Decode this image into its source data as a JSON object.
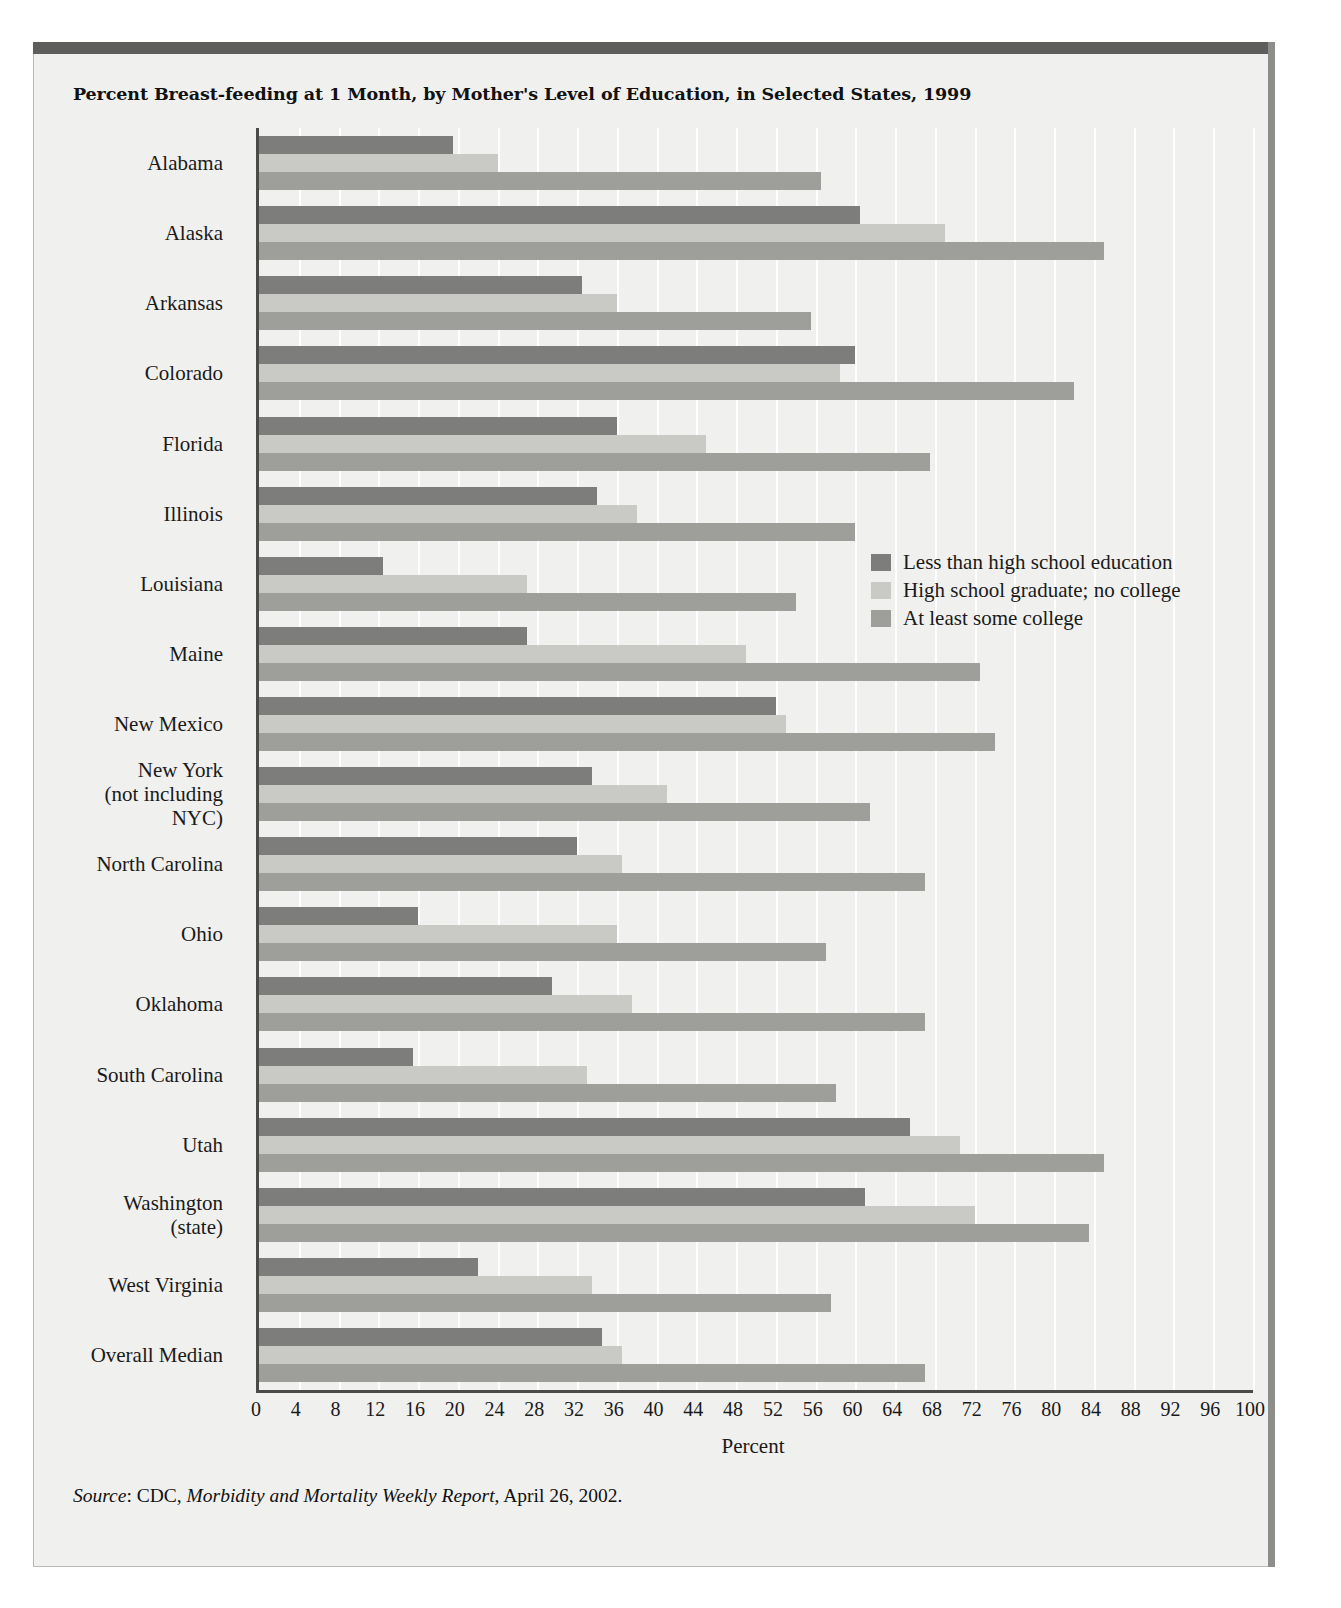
{
  "title": "Percent Breast-feeding at 1 Month, by Mother's Level of Education, in Selected States, 1999",
  "source": {
    "label": "Source",
    "agency": "CDC",
    "publication": "Morbidity and Mortality Weekly Report",
    "date": "April 26, 2002."
  },
  "legend": [
    {
      "label": "Less than high school education",
      "color": "#7d7d7b"
    },
    {
      "label": "High school graduate; no college",
      "color": "#c9c9c6"
    },
    {
      "label": "At least some college",
      "color": "#9e9e9b"
    }
  ],
  "chart_data": {
    "type": "bar",
    "orientation": "horizontal",
    "title": "Percent Breast-feeding at 1 Month, by Mother's Level of Education, in Selected States, 1999",
    "xlabel": "Percent",
    "ylabel": "",
    "xlim": [
      0,
      100
    ],
    "xticks": [
      0,
      4,
      8,
      12,
      16,
      20,
      24,
      28,
      32,
      36,
      40,
      44,
      48,
      52,
      56,
      60,
      64,
      68,
      72,
      76,
      80,
      84,
      88,
      92,
      96,
      100
    ],
    "grid": true,
    "legend_position": "right-middle",
    "categories": [
      "Alabama",
      "Alaska",
      "Arkansas",
      "Colorado",
      "Florida",
      "Illinois",
      "Louisiana",
      "Maine",
      "New Mexico",
      "New York\n(not including\nNYC)",
      "North Carolina",
      "Ohio",
      "Oklahoma",
      "South Carolina",
      "Utah",
      "Washington\n(state)",
      "West Virginia",
      "Overall Median"
    ],
    "series": [
      {
        "name": "Less than high school education",
        "color": "#7d7d7b",
        "values": [
          19.5,
          60.5,
          32.5,
          60.0,
          36.0,
          34.0,
          12.5,
          27.0,
          52.0,
          33.5,
          32.0,
          16.0,
          29.5,
          15.5,
          65.5,
          61.0,
          22.0,
          34.5
        ]
      },
      {
        "name": "High school graduate; no college",
        "color": "#c9c9c6",
        "values": [
          24.0,
          69.0,
          36.0,
          58.5,
          45.0,
          38.0,
          27.0,
          49.0,
          53.0,
          41.0,
          36.5,
          36.0,
          37.5,
          33.0,
          70.5,
          72.0,
          33.5,
          36.5
        ]
      },
      {
        "name": "At least some college",
        "color": "#9e9e9b",
        "values": [
          56.5,
          85.0,
          55.5,
          82.0,
          67.5,
          60.0,
          54.0,
          72.5,
          74.0,
          61.5,
          67.0,
          57.0,
          67.0,
          58.0,
          85.0,
          83.5,
          57.5,
          67.0
        ]
      }
    ]
  }
}
